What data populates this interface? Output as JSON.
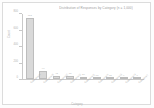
{
  "chart_data": {
    "type": "bar",
    "title": "Distribution of Responses by Category (n = 1,000)",
    "xlabel": "Category",
    "ylabel": "Count",
    "ylim": [
      0,
      800
    ],
    "grid": false,
    "legend": "none",
    "categories": [
      "Category A",
      "Category B",
      "Category C",
      "Category D",
      "Category E",
      "Category F",
      "Category G",
      "Category H",
      "Category I"
    ],
    "values": [
      752,
      96,
      42,
      33,
      26,
      18,
      12,
      9,
      6
    ],
    "value_labels": [
      "752",
      "96",
      "42",
      "33",
      "26",
      "18",
      "12",
      "9",
      "6"
    ],
    "ytick_labels": [
      "0",
      "200",
      "400",
      "600",
      "800"
    ],
    "ytick_values": [
      0,
      200,
      400,
      600,
      800
    ],
    "bar_color": "#d9d9d9",
    "bar_edge_color": "#bdbdbd",
    "axis_color": "#c9c9c9",
    "text_color": "#b0b0b0",
    "background_color": "#ffffff"
  }
}
